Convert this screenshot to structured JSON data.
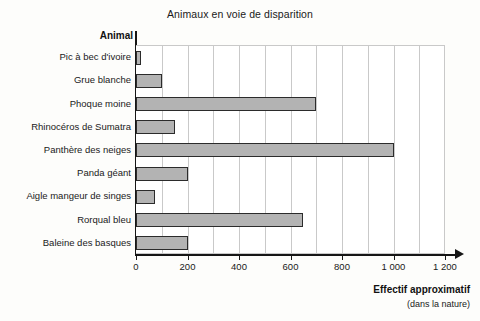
{
  "chart_data": {
    "type": "bar",
    "orientation": "horizontal",
    "title": "Animaux en voie de disparition",
    "xlabel": "Effectif approximatif",
    "xlabel_sub": "(dans la nature)",
    "ylabel": "Animal",
    "categories": [
      "Pic à bec d'ivoire",
      "Grue blanche",
      "Phoque moine",
      "Rhinocéros de Sumatra",
      "Panthère des neiges",
      "Panda géant",
      "Aigle mangeur de singes",
      "Rorqual bleu",
      "Baleine des basques"
    ],
    "values": [
      20,
      100,
      700,
      150,
      1000,
      200,
      75,
      650,
      200
    ],
    "xlim": [
      0,
      1200
    ],
    "xticks": [
      0,
      200,
      400,
      600,
      800,
      1000,
      1200
    ],
    "xtick_labels": [
      "0",
      "200",
      "400",
      "600",
      "800",
      "1 000",
      "1 200"
    ],
    "grid": true,
    "grid_step": 100,
    "legend": "none",
    "bar_color": "#b3b3b3",
    "bar_edge_color": "#2b2b2b",
    "axis_color": "#161616",
    "grid_color": "#c9c9c9"
  }
}
